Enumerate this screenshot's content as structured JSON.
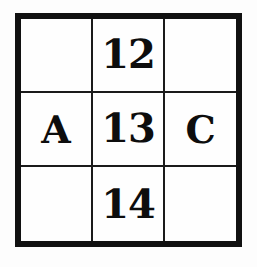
{
  "figure": {
    "type": "grid",
    "rows": 3,
    "columns": 3,
    "background_color": "#fdfdfd",
    "ink_color": "#111111",
    "outer_border_color": "#111111",
    "inner_line_color": "#1a1a1a"
  },
  "grid": {
    "cells": [
      {
        "row": 0,
        "col": 0,
        "text": "",
        "empty": true
      },
      {
        "row": 0,
        "col": 1,
        "text": "12",
        "empty": false
      },
      {
        "row": 0,
        "col": 2,
        "text": "",
        "empty": true
      },
      {
        "row": 1,
        "col": 0,
        "text": "A",
        "empty": false
      },
      {
        "row": 1,
        "col": 1,
        "text": "13",
        "empty": false
      },
      {
        "row": 1,
        "col": 2,
        "text": "C",
        "empty": false
      },
      {
        "row": 2,
        "col": 0,
        "text": "",
        "empty": true
      },
      {
        "row": 2,
        "col": 1,
        "text": "14",
        "empty": false
      },
      {
        "row": 2,
        "col": 2,
        "text": "",
        "empty": true
      }
    ]
  }
}
